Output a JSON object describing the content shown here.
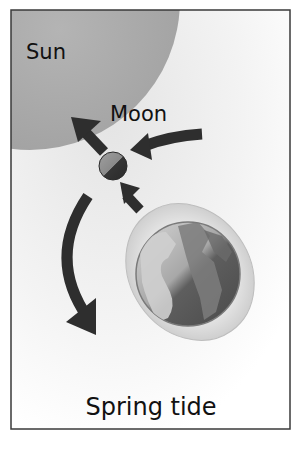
{
  "diagram": {
    "title": "Spring tide",
    "bodies": [
      {
        "id": "sun",
        "label": "Sun"
      },
      {
        "id": "moon",
        "label": "Moon"
      },
      {
        "id": "earth",
        "label": ""
      }
    ],
    "arrows": [
      {
        "id": "sun-pull-on-moon",
        "from": "moon",
        "direction": "toward-sun",
        "meaning": "gravitational pull toward Sun"
      },
      {
        "id": "moon-orbit-arrow",
        "from": "right",
        "to": "moon",
        "meaning": "Moon orbital motion"
      },
      {
        "id": "earth-pull-on-moon",
        "from": "earth",
        "to": "moon"
      },
      {
        "id": "orbit-arc-arrow",
        "shape": "curved",
        "direction": "downward"
      }
    ],
    "colors": {
      "frame": "#3a3a3a",
      "sun": "#a8a8a8",
      "arrow": "#2e2e2e",
      "moon_light": "#8f8f8f",
      "moon_dark": "#333333",
      "earth_ocean": "#5a5a5a",
      "earth_land": "#c8c8c8",
      "tidal_bulge": "#d8d8d8"
    }
  },
  "labels": {
    "sun": "Sun",
    "moon": "Moon",
    "caption": "Spring tide"
  }
}
